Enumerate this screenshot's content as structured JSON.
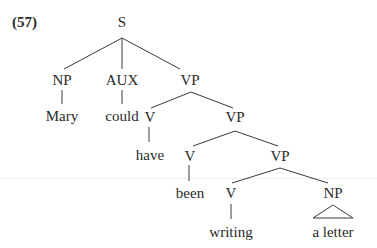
{
  "example_number": "(57)",
  "tree": {
    "nodes": [
      {
        "id": "S",
        "label": "S",
        "x": 122,
        "y": 22
      },
      {
        "id": "NP1",
        "label": "NP",
        "x": 62,
        "y": 80
      },
      {
        "id": "AUX",
        "label": "AUX",
        "x": 122,
        "y": 80
      },
      {
        "id": "VP1",
        "label": "VP",
        "x": 190,
        "y": 80
      },
      {
        "id": "Mary",
        "label": "Mary",
        "x": 62,
        "y": 116
      },
      {
        "id": "could",
        "label": "could",
        "x": 122,
        "y": 116
      },
      {
        "id": "V1",
        "label": "V",
        "x": 150,
        "y": 117
      },
      {
        "id": "VP2",
        "label": "VP",
        "x": 235,
        "y": 117
      },
      {
        "id": "have",
        "label": "have",
        "x": 150,
        "y": 155
      },
      {
        "id": "V2",
        "label": "V",
        "x": 190,
        "y": 156
      },
      {
        "id": "VP3",
        "label": "VP",
        "x": 280,
        "y": 156
      },
      {
        "id": "been",
        "label": "been",
        "x": 190,
        "y": 193
      },
      {
        "id": "V3",
        "label": "V",
        "x": 231,
        "y": 193
      },
      {
        "id": "NP2",
        "label": "NP",
        "x": 333,
        "y": 193
      },
      {
        "id": "writing",
        "label": "writing",
        "x": 231,
        "y": 232
      },
      {
        "id": "aletter",
        "label": "a letter",
        "x": 333,
        "y": 232
      }
    ],
    "edges": [
      {
        "from": "S",
        "to": "NP1",
        "x1": 122,
        "y1": 38,
        "x2": 64,
        "y2": 69
      },
      {
        "from": "S",
        "to": "AUX",
        "x1": 122,
        "y1": 38,
        "x2": 122,
        "y2": 69
      },
      {
        "from": "S",
        "to": "VP1",
        "x1": 122,
        "y1": 38,
        "x2": 180,
        "y2": 69
      },
      {
        "from": "NP1",
        "to": "Mary",
        "x1": 62,
        "y1": 90,
        "x2": 62,
        "y2": 104
      },
      {
        "from": "AUX",
        "to": "could",
        "x1": 122,
        "y1": 90,
        "x2": 122,
        "y2": 104
      },
      {
        "from": "VP1",
        "to": "V1",
        "x1": 191,
        "y1": 92,
        "x2": 151,
        "y2": 108
      },
      {
        "from": "VP1",
        "to": "VP2",
        "x1": 191,
        "y1": 92,
        "x2": 233,
        "y2": 108
      },
      {
        "from": "V1",
        "to": "have",
        "x1": 149,
        "y1": 127,
        "x2": 149,
        "y2": 142
      },
      {
        "from": "VP2",
        "to": "V2",
        "x1": 235,
        "y1": 131,
        "x2": 193,
        "y2": 146
      },
      {
        "from": "VP2",
        "to": "VP3",
        "x1": 235,
        "y1": 131,
        "x2": 278,
        "y2": 146
      },
      {
        "from": "V2",
        "to": "been",
        "x1": 189,
        "y1": 165,
        "x2": 189,
        "y2": 181
      },
      {
        "from": "VP3",
        "to": "V3",
        "x1": 280,
        "y1": 168,
        "x2": 232,
        "y2": 183
      },
      {
        "from": "VP3",
        "to": "NP2",
        "x1": 280,
        "y1": 168,
        "x2": 328,
        "y2": 183
      },
      {
        "from": "V3",
        "to": "writing",
        "x1": 231,
        "y1": 204,
        "x2": 231,
        "y2": 219
      }
    ],
    "triangles": [
      {
        "over": "NP2",
        "apex_x": 333,
        "apex_y": 205,
        "left_x": 313,
        "right_x": 353,
        "base_y": 218
      }
    ]
  }
}
